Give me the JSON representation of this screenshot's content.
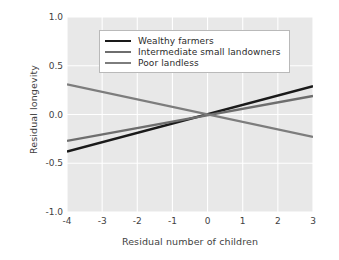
{
  "chart_data": {
    "type": "line",
    "title": "",
    "xlabel": "Residual number of children",
    "ylabel": "Residual longevity",
    "xlim": [
      -4,
      3
    ],
    "ylim": [
      -1.0,
      1.0
    ],
    "xticks": [
      "-4",
      "-3",
      "-2",
      "-1",
      "0",
      "1",
      "2",
      "3"
    ],
    "xtick_values": [
      -4,
      -3,
      -2,
      -1,
      0,
      1,
      2,
      3
    ],
    "yticks": [
      "1.0",
      "0.5",
      "0.0",
      "-0.5",
      "-1.0"
    ],
    "ytick_values": [
      1.0,
      0.5,
      0.0,
      -0.5,
      -1.0
    ],
    "grid": true,
    "grid_color": "#ffffff",
    "plot_background": "#e8e8e8",
    "legend_position": "upper center",
    "series": [
      {
        "name": "Wealthy farmers",
        "color": "#1a1a1a",
        "x": [
          -4,
          3
        ],
        "values": [
          -0.38,
          0.29
        ],
        "slope": 0.0957,
        "intercept": 0.0
      },
      {
        "name": "Intermediate small landowners",
        "color": "#6e6e6e",
        "x": [
          -4,
          3
        ],
        "values": [
          -0.27,
          0.19
        ],
        "slope": 0.0657,
        "intercept": 0.0
      },
      {
        "name": "Poor landless",
        "color": "#7d7d7d",
        "x": [
          -4,
          3
        ],
        "values": [
          0.31,
          -0.23
        ],
        "slope": -0.0771,
        "intercept": 0.0
      }
    ]
  }
}
